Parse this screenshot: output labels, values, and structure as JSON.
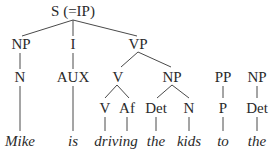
{
  "tree": {
    "root": "S (=IP)",
    "level2": [
      "NP",
      "I",
      "VP"
    ],
    "level3": [
      "N",
      "AUX",
      "V",
      "NP",
      "PP",
      "NP"
    ],
    "level4": [
      "V",
      "Af",
      "Det",
      "N",
      "P",
      "Det"
    ],
    "words": [
      "Mike",
      "is",
      "driving",
      "the",
      "kids",
      "to",
      "the"
    ]
  },
  "colors": {
    "text": "#2a2a2a",
    "lines": "#4a4a4a",
    "background": "#ffffff"
  }
}
